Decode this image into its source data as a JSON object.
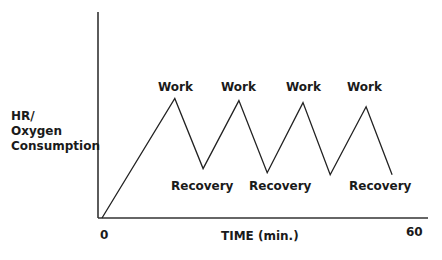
{
  "diagram": {
    "y_axis_label": [
      "HR/",
      "Oxygen",
      "Consumption"
    ],
    "x_axis_label": "TIME (min.)",
    "x_ticks": [
      {
        "label": "0",
        "x": 100,
        "y": 228
      },
      {
        "label": "60",
        "x": 406,
        "y": 225
      }
    ],
    "annotations": [
      {
        "text": "Work",
        "x": 158,
        "y": 80
      },
      {
        "text": "Work",
        "x": 221,
        "y": 80
      },
      {
        "text": "Work",
        "x": 286,
        "y": 80
      },
      {
        "text": "Work",
        "x": 347,
        "y": 80
      },
      {
        "text": "Recovery",
        "x": 171,
        "y": 179
      },
      {
        "text": "Recovery",
        "x": 249,
        "y": 179
      },
      {
        "text": "Recovery",
        "x": 349,
        "y": 179
      }
    ],
    "line_color": "#222222"
  },
  "chart_data": {
    "type": "line",
    "title": "",
    "xlabel": "TIME (min.)",
    "ylabel": "HR/ Oxygen Consumption",
    "xlim": [
      0,
      60
    ],
    "ylim": [
      0,
      100
    ],
    "x_tick_labels": [
      "0",
      "60"
    ],
    "grid": false,
    "series": [
      {
        "name": "HR/Oxygen Consumption",
        "x": [
          0,
          13.4,
          18.6,
          25.2,
          30.4,
          37.0,
          42.0,
          48.6,
          53.4
        ],
        "y": [
          0,
          58,
          24,
          57,
          22,
          56,
          21,
          54,
          21
        ]
      }
    ],
    "annotations": [
      "Work",
      "Work",
      "Work",
      "Work",
      "Recovery",
      "Recovery",
      "Recovery"
    ]
  }
}
